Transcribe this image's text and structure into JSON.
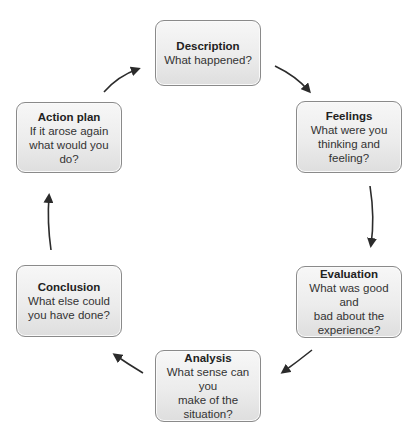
{
  "diagram": {
    "type": "cycle",
    "nodes": [
      {
        "id": "description",
        "title": "Description",
        "lines": [
          "What happened?"
        ]
      },
      {
        "id": "feelings",
        "title": "Feelings",
        "lines": [
          "What were you",
          "thinking and",
          "feeling?"
        ]
      },
      {
        "id": "evaluation",
        "title": "Evaluation",
        "lines": [
          "What was good and",
          "bad about the",
          "experience?"
        ]
      },
      {
        "id": "analysis",
        "title": "Analysis",
        "lines": [
          "What sense can you",
          "make of the",
          "situation?"
        ]
      },
      {
        "id": "conclusion",
        "title": "Conclusion",
        "lines": [
          "What else could",
          "you have done?"
        ]
      },
      {
        "id": "action_plan",
        "title": "Action plan",
        "lines": [
          "If it arose again",
          "what would you do?"
        ]
      }
    ],
    "edges": [
      {
        "from": "description",
        "to": "feelings"
      },
      {
        "from": "feelings",
        "to": "evaluation"
      },
      {
        "from": "evaluation",
        "to": "analysis"
      },
      {
        "from": "analysis",
        "to": "conclusion"
      },
      {
        "from": "conclusion",
        "to": "action_plan"
      },
      {
        "from": "action_plan",
        "to": "description"
      }
    ],
    "colors": {
      "box_border": "#8a8a8a",
      "box_fill_top": "#f7f7f7",
      "box_fill_bottom": "#dedede",
      "arrow": "#2b2b2b",
      "text": "#2a2a2a"
    }
  }
}
